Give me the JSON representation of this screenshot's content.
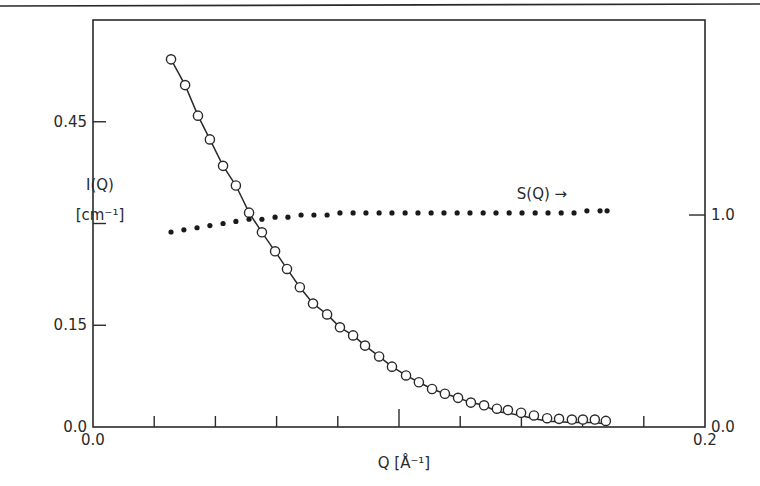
{
  "chart_data": {
    "type": "scatter",
    "title": "",
    "xlabel": "Q [Å⁻¹]",
    "ylabel_left": "I(Q) [cm⁻¹]",
    "ylabel_right": "S(Q)",
    "annotation": "S(Q) →",
    "xlim": [
      0.0,
      0.2
    ],
    "ylim_left": [
      0.0,
      0.6
    ],
    "ylim_right": [
      0.0,
      1.92
    ],
    "grid": false,
    "legend": "none",
    "x_ticks": [
      0.0,
      0.02,
      0.04,
      0.06,
      0.08,
      0.1,
      0.12,
      0.14,
      0.16,
      0.18,
      0.2
    ],
    "x_tick_labels": [
      {
        "value": 0.0,
        "label": "0.0"
      },
      {
        "value": 0.2,
        "label": "0.2"
      }
    ],
    "y_left_ticks": [
      0.0,
      0.15,
      0.3,
      0.45
    ],
    "y_left_tick_labels": [
      {
        "value": 0.0,
        "label": "0.0"
      },
      {
        "value": 0.15,
        "label": "0.15"
      },
      {
        "value": 0.45,
        "label": "0.45"
      }
    ],
    "y_right_ticks": [
      0.0,
      1.0
    ],
    "y_right_tick_labels": [
      {
        "value": 0.0,
        "label": "0.0"
      },
      {
        "value": 1.0,
        "label": "1.0"
      }
    ],
    "series": [
      {
        "name": "I(Q) measured",
        "marker": "open-circle",
        "axis": "left",
        "x": [
          0.0255,
          0.0301,
          0.0343,
          0.0382,
          0.0425,
          0.0467,
          0.051,
          0.0552,
          0.0595,
          0.0634,
          0.0676,
          0.0719,
          0.0765,
          0.0807,
          0.085,
          0.0889,
          0.0935,
          0.0977,
          0.1023,
          0.1065,
          0.1108,
          0.115,
          0.1193,
          0.1235,
          0.1278,
          0.132,
          0.1356,
          0.1399,
          0.1441,
          0.1484,
          0.1523,
          0.1565,
          0.1601,
          0.164,
          0.1676
        ],
        "y": [
          0.542,
          0.504,
          0.459,
          0.424,
          0.385,
          0.356,
          0.316,
          0.287,
          0.259,
          0.233,
          0.206,
          0.182,
          0.166,
          0.147,
          0.135,
          0.12,
          0.104,
          0.089,
          0.076,
          0.066,
          0.056,
          0.049,
          0.043,
          0.036,
          0.032,
          0.027,
          0.025,
          0.021,
          0.017,
          0.013,
          0.012,
          0.011,
          0.011,
          0.011,
          0.009
        ]
      },
      {
        "name": "I(Q) fit",
        "marker": "none",
        "line": "solid",
        "axis": "left",
        "x": [
          0.0255,
          0.0425,
          0.0595,
          0.0765,
          0.0935,
          0.1108,
          0.1278,
          0.1441,
          0.1601,
          0.168
        ],
        "y": [
          0.542,
          0.385,
          0.259,
          0.166,
          0.104,
          0.058,
          0.034,
          0.022,
          0.015,
          0.012
        ]
      },
      {
        "name": "S(Q)",
        "marker": "filled-dot",
        "axis": "right",
        "x": [
          0.0255,
          0.0297,
          0.034,
          0.0382,
          0.0425,
          0.0467,
          0.051,
          0.0552,
          0.0595,
          0.0637,
          0.068,
          0.0722,
          0.0765,
          0.0807,
          0.085,
          0.0892,
          0.0935,
          0.0977,
          0.102,
          0.1062,
          0.1105,
          0.1147,
          0.119,
          0.1232,
          0.1275,
          0.1317,
          0.136,
          0.1402,
          0.1445,
          0.1487,
          0.153,
          0.1572,
          0.1614,
          0.1657,
          0.168
        ],
        "y": [
          0.92,
          0.93,
          0.94,
          0.95,
          0.96,
          0.97,
          0.98,
          0.98,
          0.99,
          0.99,
          1.0,
          1.0,
          1.0,
          1.01,
          1.01,
          1.01,
          1.01,
          1.01,
          1.01,
          1.01,
          1.01,
          1.01,
          1.01,
          1.01,
          1.01,
          1.01,
          1.01,
          1.01,
          1.01,
          1.01,
          1.01,
          1.01,
          1.02,
          1.02,
          1.02
        ]
      }
    ]
  },
  "labels": {
    "y_left_title_line1": "I(Q)",
    "y_left_title_line2": "[cm⁻¹]",
    "x_title": "Q [Å⁻¹]",
    "sq_annotation": "S(Q) →"
  }
}
